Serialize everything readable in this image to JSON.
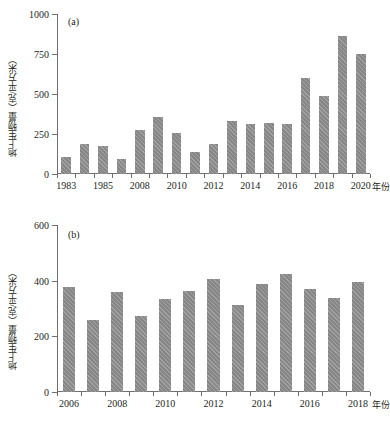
{
  "figure": {
    "width": 386,
    "height": 426,
    "bar_color": "#878787",
    "axis_color": "#6f6f6f",
    "text_color": "#231f20"
  },
  "panels": [
    {
      "id": "a",
      "tag": "(a)",
      "ylabel": "地上生物量（克/平方米）",
      "xlabel": "年份",
      "yticks": [
        0,
        250,
        500,
        750,
        1000
      ],
      "ytick_labels": [
        "0",
        "250",
        "500",
        "750",
        "1000"
      ],
      "xtick_labels": [
        "1983",
        "1985",
        "2008",
        "2010",
        "2012",
        "2014",
        "2016",
        "2018",
        "2020"
      ]
    },
    {
      "id": "b",
      "tag": "(b)",
      "ylabel": "地上生物量（克/平方米）",
      "xlabel": "年份",
      "yticks": [
        0,
        200,
        400,
        600
      ],
      "ytick_labels": [
        "0",
        "200",
        "400",
        "600"
      ],
      "xtick_labels": [
        "2006",
        "2008",
        "2010",
        "2012",
        "2014",
        "2016",
        "2018"
      ]
    }
  ],
  "chart_data": [
    {
      "type": "bar",
      "panel": "a",
      "title": "(a)",
      "xlabel": "年份",
      "ylabel": "地上生物量（克/平方米）",
      "ylim": [
        0,
        1000
      ],
      "yticks": [
        0,
        250,
        500,
        750,
        1000
      ],
      "grid": false,
      "legend": null,
      "categories": [
        "1983",
        "1984",
        "1985",
        "1986",
        "2008",
        "2009",
        "2010",
        "2011",
        "2012",
        "2013",
        "2014",
        "2015",
        "2016",
        "2017",
        "2018",
        "2019",
        "2020"
      ],
      "tick_categories": [
        "1983",
        "1985",
        "2008",
        "2010",
        "2012",
        "2014",
        "2016",
        "2018",
        "2020"
      ],
      "values": [
        105,
        190,
        178,
        95,
        272,
        356,
        258,
        137,
        186,
        332,
        311,
        318,
        311,
        603,
        489,
        862,
        750
      ]
    },
    {
      "type": "bar",
      "panel": "b",
      "title": "(b)",
      "xlabel": "年份",
      "ylabel": "地上生物量（克/平方米）",
      "ylim": [
        0,
        600
      ],
      "yticks": [
        0,
        200,
        400,
        600
      ],
      "grid": false,
      "legend": null,
      "categories": [
        "2006",
        "2007",
        "2008",
        "2009",
        "2010",
        "2011",
        "2012",
        "2013",
        "2014",
        "2015",
        "2016",
        "2017",
        "2018"
      ],
      "tick_categories": [
        "2006",
        "2008",
        "2010",
        "2012",
        "2014",
        "2016",
        "2018"
      ],
      "values": [
        378,
        257,
        358,
        274,
        334,
        364,
        406,
        312,
        389,
        425,
        371,
        336,
        394
      ]
    }
  ]
}
